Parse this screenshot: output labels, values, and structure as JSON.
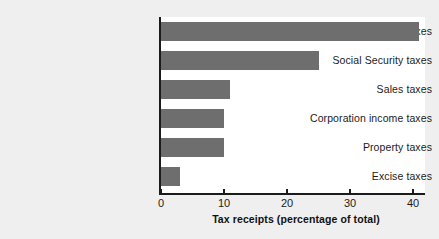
{
  "chart_data": {
    "type": "bar",
    "orientation": "horizontal",
    "title": "",
    "xlabel": "Tax receipts (percentage of total)",
    "ylabel": "",
    "categories": [
      "Personal income taxes",
      "Social Security taxes",
      "Sales taxes",
      "Corporation income taxes",
      "Property taxes",
      "Excise taxes"
    ],
    "values": [
      41,
      25,
      11,
      10,
      10,
      3
    ],
    "xlim": [
      0,
      42
    ],
    "xticks": [
      0,
      10,
      20,
      30,
      40
    ],
    "xtick_labels": [
      "0",
      "10",
      "20",
      "30",
      "40"
    ],
    "grid": false,
    "legend": false,
    "bar_color": "#6e6e6e",
    "axis_color": "#1b1b1b",
    "plot_background": "#ffffff",
    "figure_background": "#efefef"
  }
}
